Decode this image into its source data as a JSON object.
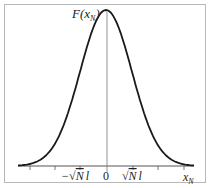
{
  "chart_data": {
    "type": "line",
    "title": "",
    "xlabel": "x_N",
    "ylabel": "F(x_N)",
    "x_tick_labels": [
      "-√N l",
      "0",
      "√N l"
    ],
    "x_tick_count": 7,
    "grid": false,
    "legend": null,
    "series": [
      {
        "name": "F(x_N)",
        "x": [
          -3,
          -2.5,
          -2,
          -1.5,
          -1,
          -0.5,
          0,
          0.5,
          1,
          1.5,
          2,
          2.5,
          3
        ],
        "values": [
          0.011,
          0.044,
          0.135,
          0.325,
          0.607,
          0.882,
          1.0,
          0.882,
          0.607,
          0.325,
          0.135,
          0.044,
          0.011
        ]
      }
    ],
    "xlim": [
      -3.4,
      3.4
    ],
    "ylim": [
      0,
      1.0
    ]
  },
  "labels": {
    "ylabel_F": "F(",
    "ylabel_x": "x",
    "ylabel_sub": "N",
    "ylabel_close": ")",
    "xlabel_x": "x",
    "xlabel_sub": "N",
    "tick_neg_minus": "−",
    "tick_sqrt": "√",
    "tick_N": "N",
    "tick_l": "l",
    "tick_zero": "0"
  },
  "colors": {
    "curve": "#1a1a1a",
    "axis": "#555555",
    "border": "#b8b8b8"
  }
}
